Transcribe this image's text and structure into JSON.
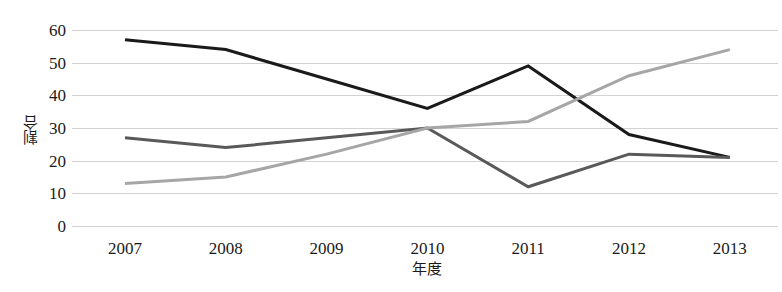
{
  "chart_data": {
    "type": "line",
    "title": "",
    "subtitle": "",
    "xlabel": "年度",
    "ylabel": "割合",
    "categories": [
      "2007",
      "2008",
      "2009",
      "2010",
      "2011",
      "2012",
      "2013"
    ],
    "x": [
      2007,
      2008,
      2009,
      2010,
      2011,
      2012,
      2013
    ],
    "ylim": [
      0,
      60
    ],
    "yticks": [
      "60",
      "50",
      "40",
      "30",
      "20",
      "10",
      "0"
    ],
    "ytick_values": [
      60,
      50,
      40,
      30,
      20,
      10,
      0
    ],
    "grid": true,
    "grid_axis": "y",
    "legend": "none",
    "markers": "none",
    "series": [
      {
        "name": "series-black",
        "color": "#1a1a1a",
        "width": 3,
        "values": [
          57,
          54,
          45,
          36,
          49,
          28,
          21
        ]
      },
      {
        "name": "series-dark-gray",
        "color": "#595959",
        "width": 3,
        "values": [
          27,
          24,
          27,
          30,
          12,
          22,
          21
        ]
      },
      {
        "name": "series-light-gray",
        "color": "#a6a6a6",
        "width": 3,
        "values": [
          13,
          15,
          22,
          30,
          32,
          46,
          54
        ]
      }
    ]
  },
  "axes": {
    "y_title": "割合",
    "x_title": "年度"
  }
}
